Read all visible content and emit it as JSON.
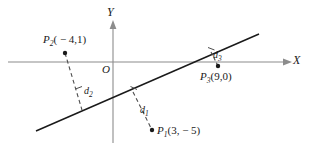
{
  "figure": {
    "type": "geometry-diagram",
    "background_color": "#ffffff",
    "axis_color": "#8c8c8c",
    "line_color": "#1a1a1a",
    "dash_color": "#4d4d4d",
    "text_color": "#1a1a1a"
  },
  "axes": {
    "x_label": "X",
    "y_label": "Y",
    "origin_label": "O"
  },
  "points": [
    {
      "id": "P1",
      "name": "P",
      "subscript": "1",
      "coords_text": "(3, − 5)",
      "x": 3,
      "y": -5,
      "label": "P1(3, − 5)"
    },
    {
      "id": "P2",
      "name": "P",
      "subscript": "2",
      "coords_text": "( − 4,1)",
      "x": -4,
      "y": 1,
      "label": "P2( − 4,1)"
    },
    {
      "id": "P3",
      "name": "P",
      "subscript": "3",
      "coords_text": "(9,0)",
      "x": 9,
      "y": 0,
      "label": "P3(9,0)"
    }
  ],
  "distances": [
    {
      "id": "d1",
      "name": "d",
      "subscript": "1",
      "from_point": "P1"
    },
    {
      "id": "d2",
      "name": "d",
      "subscript": "2",
      "from_point": "P2"
    },
    {
      "id": "d3",
      "name": "d",
      "subscript": "3",
      "from_point": "P3"
    }
  ]
}
